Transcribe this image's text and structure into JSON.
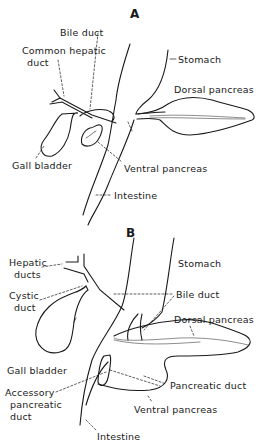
{
  "panel_a": {
    "letter": "A",
    "labels": {
      "bile_duct": "Bile duct",
      "common_hepatic_1": "Common hepatic",
      "common_hepatic_2": "duct",
      "stomach": "Stomach",
      "dorsal_pancreas": "Dorsal pancreas",
      "gall_bladder": "Gall bladder",
      "ventral_pancreas": "Ventral pancreas",
      "intestine": "Intestine"
    }
  },
  "panel_b": {
    "letter": "B",
    "labels": {
      "hepatic_ducts_1": "Hepatic",
      "hepatic_ducts_2": "ducts",
      "stomach": "Stomach",
      "cystic_duct_1": "Cystic",
      "cystic_duct_2": "duct",
      "bile_duct": "Bile duct",
      "dorsal_pancreas": "Dorsal pancreas",
      "gall_bladder": "Gall bladder",
      "accessory_1": "Accessory",
      "accessory_2": "pancreatic",
      "accessory_3": "duct",
      "pancreatic_duct": "Pancreatic duct",
      "ventral_pancreas": "Ventral pancreas",
      "intestine": "Intestine"
    }
  },
  "colors": {
    "line": "#1a1a1a",
    "background": "#ffffff"
  }
}
